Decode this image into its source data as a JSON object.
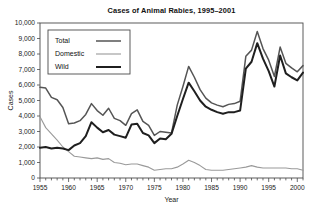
{
  "chart_data": {
    "type": "line",
    "title": "Cases of Animal Rabies, 1995–2001",
    "xlabel": "Year",
    "ylabel": "Cases",
    "xlim": [
      1955,
      2001
    ],
    "ylim": [
      0,
      10000
    ],
    "xticks": [
      1955,
      1960,
      1965,
      1970,
      1975,
      1980,
      1985,
      1990,
      1995,
      2000
    ],
    "xticklabels": [
      "1955",
      "1960",
      "1965",
      "1970",
      "1975",
      "1980",
      "1985",
      "1990",
      "1995",
      "2000"
    ],
    "yticks": [
      0,
      1000,
      2000,
      3000,
      4000,
      5000,
      6000,
      7000,
      8000,
      9000,
      10000
    ],
    "yticklabels": [
      "0",
      "1,000",
      "2,000",
      "3,000",
      "4,000",
      "5,000",
      "6,000",
      "7,000",
      "8,000",
      "9,000",
      "10,000"
    ],
    "grid": false,
    "legend_position": "upper-left",
    "x": [
      1955,
      1956,
      1957,
      1958,
      1959,
      1960,
      1961,
      1962,
      1963,
      1964,
      1965,
      1966,
      1967,
      1968,
      1969,
      1970,
      1971,
      1972,
      1973,
      1974,
      1975,
      1976,
      1977,
      1978,
      1979,
      1980,
      1981,
      1982,
      1983,
      1984,
      1985,
      1986,
      1987,
      1988,
      1989,
      1990,
      1991,
      1992,
      1993,
      1994,
      1995,
      1996,
      1997,
      1998,
      1999,
      2000,
      2001
    ],
    "series": [
      {
        "name": "Total",
        "color": "#555555",
        "width": 1.5,
        "values": [
          5850,
          5800,
          5200,
          5050,
          4550,
          3500,
          3550,
          3700,
          4100,
          4800,
          4350,
          4050,
          4500,
          3850,
          3700,
          3400,
          4150,
          4400,
          3650,
          3400,
          2750,
          3000,
          2950,
          2900,
          4700,
          5900,
          7200,
          6500,
          5700,
          5150,
          4850,
          4700,
          4600,
          4750,
          4800,
          4950,
          7850,
          8250,
          9450,
          8350,
          7600,
          6550,
          8450,
          7400,
          7100,
          6850,
          7250
        ]
      },
      {
        "name": "Domestic",
        "color": "#9a9a9a",
        "width": 1.1,
        "values": [
          3950,
          3250,
          2850,
          2450,
          2000,
          1700,
          1400,
          1350,
          1300,
          1250,
          1300,
          1200,
          1250,
          1000,
          950,
          850,
          900,
          900,
          800,
          700,
          500,
          550,
          600,
          600,
          700,
          900,
          1150,
          1000,
          800,
          550,
          500,
          500,
          500,
          550,
          600,
          650,
          700,
          800,
          700,
          650,
          650,
          650,
          650,
          650,
          600,
          600,
          500
        ]
      },
      {
        "name": "Wild",
        "color": "#1f1f1f",
        "width": 2.0,
        "values": [
          1950,
          2000,
          1900,
          1950,
          1900,
          1800,
          2100,
          2250,
          2700,
          3600,
          3250,
          2950,
          3100,
          2800,
          2700,
          2600,
          3450,
          3500,
          2900,
          2750,
          2250,
          2550,
          2500,
          2850,
          4000,
          5100,
          6150,
          5600,
          5000,
          4600,
          4400,
          4250,
          4150,
          4250,
          4250,
          4350,
          7050,
          7500,
          8700,
          7700,
          6900,
          5900,
          7900,
          6750,
          6500,
          6300,
          6800
        ]
      }
    ]
  }
}
